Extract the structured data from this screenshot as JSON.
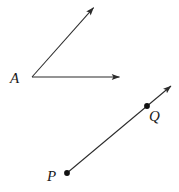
{
  "figure": {
    "type": "geometry-diagram",
    "width": 179,
    "height": 192,
    "background_color": "#ffffff",
    "stroke_color": "#2b2b2b",
    "stroke_width": 1,
    "labels": {
      "vertex_a": "A",
      "point_p": "P",
      "point_q": "Q"
    },
    "shapes": [
      {
        "name": "angle-a",
        "kind": "angle",
        "vertex": {
          "x": 32,
          "y": 77
        },
        "rays": [
          {
            "name": "ray-a-horizontal",
            "from": {
              "x": 32,
              "y": 77
            },
            "to": {
              "x": 121,
              "y": 77
            },
            "arrowhead": "end"
          },
          {
            "name": "ray-a-diagonal",
            "from": {
              "x": 32,
              "y": 77
            },
            "to": {
              "x": 95,
              "y": 6
            },
            "arrowhead": "end"
          }
        ]
      },
      {
        "name": "ray-pq",
        "kind": "ray",
        "from": {
          "x": 67,
          "y": 173
        },
        "through": {
          "x": 147,
          "y": 106
        },
        "to": {
          "x": 173,
          "y": 84
        },
        "arrowhead": "end",
        "endpoints": [
          {
            "name": "point-p",
            "x": 67,
            "y": 173,
            "dot": true
          },
          {
            "name": "point-q",
            "x": 147,
            "y": 106,
            "dot": true
          }
        ]
      }
    ]
  }
}
